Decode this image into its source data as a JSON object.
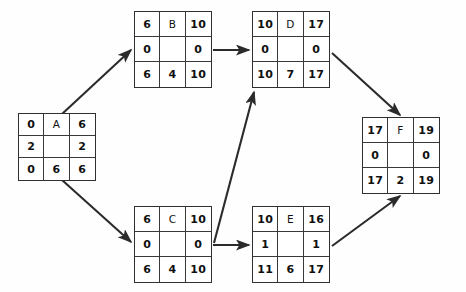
{
  "diagram": {
    "node_layout": {
      "cells": [
        "early-start",
        "activity-name",
        "early-finish",
        "total-float-left",
        "center-blank",
        "total-float-right",
        "late-start",
        "duration",
        "late-finish"
      ]
    },
    "colors": {
      "background": "#fefefe",
      "node_border": "#303030",
      "cell_border": "#3a3a3a",
      "text": "#101010",
      "edge": "#2b2b2b"
    },
    "nodes": [
      {
        "id": "A",
        "x": 18,
        "y": 113,
        "w": 78,
        "h": 68,
        "early_start": "0",
        "name": "A",
        "early_finish": "6",
        "float_left": "2",
        "center": "",
        "float_right": "2",
        "late_start": "0",
        "duration": "6",
        "late_finish": "6"
      },
      {
        "id": "B",
        "x": 134,
        "y": 11,
        "w": 78,
        "h": 77,
        "early_start": "6",
        "name": "B",
        "early_finish": "10",
        "float_left": "0",
        "center": "",
        "float_right": "0",
        "late_start": "6",
        "duration": "4",
        "late_finish": "10"
      },
      {
        "id": "D",
        "x": 252,
        "y": 11,
        "w": 78,
        "h": 77,
        "early_start": "10",
        "name": "D",
        "early_finish": "17",
        "float_left": "0",
        "center": "",
        "float_right": "0",
        "late_start": "10",
        "duration": "7",
        "late_finish": "17"
      },
      {
        "id": "F",
        "x": 362,
        "y": 117,
        "w": 78,
        "h": 77,
        "early_start": "17",
        "name": "F",
        "early_finish": "19",
        "float_left": "0",
        "center": "",
        "float_right": "0",
        "late_start": "17",
        "duration": "2",
        "late_finish": "19"
      },
      {
        "id": "C",
        "x": 134,
        "y": 206,
        "w": 78,
        "h": 77,
        "early_start": "6",
        "name": "C",
        "early_finish": "10",
        "float_left": "0",
        "center": "",
        "float_right": "0",
        "late_start": "6",
        "duration": "4",
        "late_finish": "10"
      },
      {
        "id": "E",
        "x": 252,
        "y": 206,
        "w": 78,
        "h": 77,
        "early_start": "10",
        "name": "E",
        "early_finish": "16",
        "float_left": "1",
        "center": "",
        "float_right": "1",
        "late_start": "11",
        "duration": "6",
        "late_finish": "17"
      }
    ],
    "edges": [
      {
        "id": "A-to-B",
        "from": "A",
        "to": "B",
        "x1": 62,
        "y1": 114,
        "x2": 131,
        "y2": 50
      },
      {
        "id": "A-to-C",
        "from": "A",
        "to": "C",
        "x1": 62,
        "y1": 180,
        "x2": 131,
        "y2": 242
      },
      {
        "id": "B-to-D",
        "from": "B",
        "to": "D",
        "x1": 213,
        "y1": 50,
        "x2": 249,
        "y2": 50
      },
      {
        "id": "C-to-D",
        "from": "C",
        "to": "D",
        "x1": 214,
        "y1": 243,
        "x2": 254,
        "y2": 92
      },
      {
        "id": "C-to-E",
        "from": "C",
        "to": "E",
        "x1": 213,
        "y1": 245,
        "x2": 249,
        "y2": 245
      },
      {
        "id": "D-to-F",
        "from": "D",
        "to": "F",
        "x1": 332,
        "y1": 53,
        "x2": 400,
        "y2": 115
      },
      {
        "id": "E-to-F",
        "from": "E",
        "to": "F",
        "x1": 332,
        "y1": 246,
        "x2": 400,
        "y2": 196
      }
    ]
  }
}
